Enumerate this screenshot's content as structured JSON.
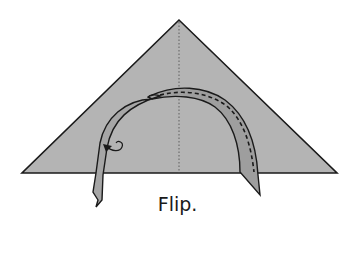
{
  "diagram": {
    "type": "origami-step",
    "caption": "Flip.",
    "colors": {
      "paper": "#b4b4b4",
      "band": "#9e9e9e",
      "outline": "#1a1a1a",
      "background": "#ffffff"
    },
    "elements": [
      "triangle-paper",
      "center-crease-valley-dotted",
      "curved-band",
      "dashed-fold-line",
      "flip-arrow"
    ]
  }
}
